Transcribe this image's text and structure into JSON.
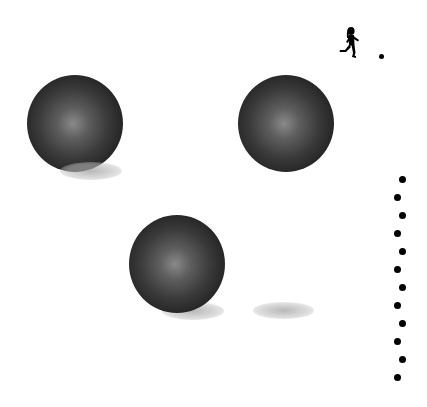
{
  "scene": {
    "background": "#ffffff",
    "spheres": [
      {
        "id": "sphere-1",
        "x": 27,
        "y": 75,
        "size": 96,
        "shadow": {
          "x": 62,
          "y": 163,
          "w": 60,
          "h": 18
        }
      },
      {
        "id": "sphere-2",
        "x": 238,
        "y": 75,
        "size": 96,
        "shadow": null
      },
      {
        "id": "sphere-3",
        "x": 129,
        "y": 215,
        "size": 96,
        "shadow": {
          "x": 164,
          "y": 302,
          "w": 60,
          "h": 18
        }
      }
    ],
    "loose_shadow": {
      "x": 254,
      "y": 302,
      "w": 60,
      "h": 18
    },
    "runner": {
      "icon": "running-person-icon",
      "x": 340,
      "y": 28
    },
    "goal_dot": {
      "x": 379,
      "y": 54,
      "size": 5
    },
    "dot_column": [
      {
        "x": 399,
        "y": 176
      },
      {
        "x": 394,
        "y": 194
      },
      {
        "x": 399,
        "y": 212
      },
      {
        "x": 394,
        "y": 230
      },
      {
        "x": 399,
        "y": 248
      },
      {
        "x": 394,
        "y": 266
      },
      {
        "x": 399,
        "y": 284
      },
      {
        "x": 394,
        "y": 302
      },
      {
        "x": 399,
        "y": 320
      },
      {
        "x": 394,
        "y": 338
      },
      {
        "x": 399,
        "y": 356
      },
      {
        "x": 394,
        "y": 374
      }
    ]
  }
}
